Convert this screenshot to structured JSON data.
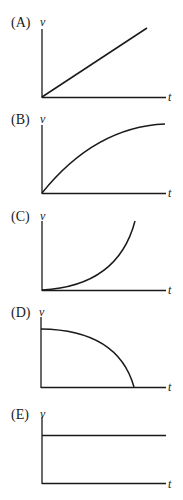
{
  "figure": {
    "line_color": "#1a1a1a",
    "panels": [
      {
        "label": "(A)",
        "y_axis": "v",
        "x_axis": "t",
        "shape": "linear increasing from origin"
      },
      {
        "label": "(B)",
        "y_axis": "v",
        "x_axis": "t",
        "shape": "increasing, concave down (leveling off)"
      },
      {
        "label": "(C)",
        "y_axis": "v",
        "x_axis": "t",
        "shape": "increasing, concave up (accelerating growth)"
      },
      {
        "label": "(D)",
        "y_axis": "v",
        "x_axis": "t",
        "shape": "decreasing from nonzero value to zero, concave down"
      },
      {
        "label": "(E)",
        "y_axis": "v",
        "x_axis": "t",
        "shape": "constant nonzero"
      }
    ]
  }
}
